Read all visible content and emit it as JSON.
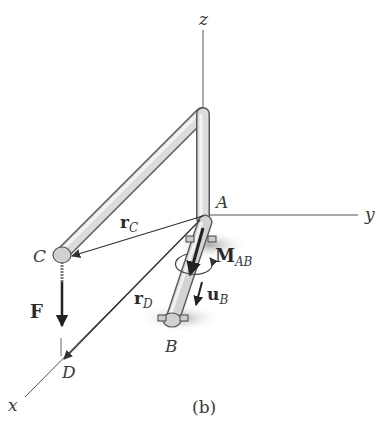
{
  "figure": {
    "caption": "(b)",
    "axes": {
      "x": "x",
      "y": "y",
      "z": "z"
    },
    "points": {
      "A": "A",
      "B": "B",
      "C": "C",
      "D": "D"
    },
    "vectors": {
      "rC": {
        "main": "r",
        "sub": "C"
      },
      "rD": {
        "main": "r",
        "sub": "D"
      },
      "uB": {
        "main": "u",
        "sub": "B"
      },
      "MAB": {
        "main": "M",
        "sub": "AB"
      },
      "F": {
        "main": "F"
      }
    },
    "colors": {
      "line": "#4a4a4a",
      "pipe_fill": "#d8d8d8",
      "pipe_edge": "#5a5a5a",
      "shadow": "#bdbdbd",
      "arrow": "#222222"
    }
  }
}
